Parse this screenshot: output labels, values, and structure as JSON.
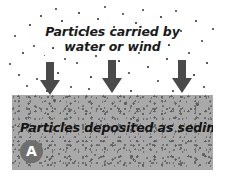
{
  "figure": {
    "panel_label": "A"
  },
  "transport": {
    "line1": "Particles carried by",
    "line2": "water or wind"
  },
  "sediment": {
    "caption": "Particles deposited as sediment"
  },
  "arrows": [
    {
      "name": "deposition-arrow-left",
      "direction": "down"
    },
    {
      "name": "deposition-arrow-center",
      "direction": "down"
    },
    {
      "name": "deposition-arrow-right",
      "direction": "down"
    }
  ],
  "colors": {
    "background": "#ffffff",
    "sediment_fill": "#a9a9a9",
    "sediment_speck": "#5c5c5c",
    "arrow": "#4a4a4a",
    "particle": "#3a3a3a",
    "badge_fill": "#6f6f6f",
    "badge_text": "#ffffff",
    "text": "#151515"
  }
}
